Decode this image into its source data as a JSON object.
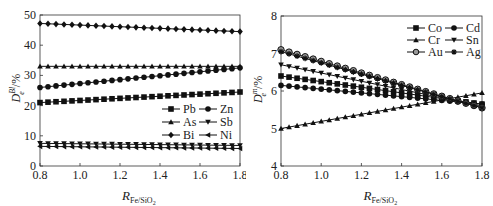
{
  "chart_data": [
    {
      "type": "line",
      "title": "",
      "xlabel": "R_Fe/SiO2",
      "ylabel": "D_e^Bl/%",
      "xlim": [
        0.8,
        1.8
      ],
      "ylim": [
        0,
        50
      ],
      "xticks": [
        "0.8",
        "1.0",
        "1.2",
        "1.4",
        "1.6",
        "1.8"
      ],
      "yticks": [
        "0",
        "10",
        "20",
        "30",
        "40",
        "50"
      ],
      "grid": false,
      "legend_position": "center-right",
      "x": [
        0.8,
        1.8
      ],
      "series": [
        {
          "name": "Pb",
          "marker": "square",
          "values": [
            21.0,
            24.5
          ]
        },
        {
          "name": "Zn",
          "marker": "circle",
          "values": [
            26.0,
            32.5
          ]
        },
        {
          "name": "As",
          "marker": "triangle-up",
          "values": [
            33.0,
            33.0
          ]
        },
        {
          "name": "Sb",
          "marker": "triangle-down",
          "values": [
            7.5,
            6.8
          ]
        },
        {
          "name": "Bi",
          "marker": "diamond",
          "values": [
            47.2,
            44.5
          ]
        },
        {
          "name": "Ni",
          "marker": "triangle-left",
          "values": [
            6.5,
            5.8
          ]
        }
      ]
    },
    {
      "type": "line",
      "title": "",
      "xlabel": "R_Fe/SiO2",
      "ylabel": "D_e^m/%",
      "xlim": [
        0.8,
        1.8
      ],
      "ylim": [
        4,
        8
      ],
      "xticks": [
        "0.8",
        "1.0",
        "1.2",
        "1.4",
        "1.6",
        "1.8"
      ],
      "yticks": [
        "4",
        "5",
        "6",
        "7",
        "8"
      ],
      "grid": false,
      "legend_position": "upper-right",
      "x": [
        0.8,
        1.8
      ],
      "series": [
        {
          "name": "Co",
          "marker": "square",
          "values": [
            6.4,
            5.65
          ]
        },
        {
          "name": "Cd",
          "marker": "circle",
          "values": [
            6.15,
            5.65
          ]
        },
        {
          "name": "Cr",
          "marker": "triangle-up",
          "values": [
            5.0,
            5.95
          ]
        },
        {
          "name": "Sn",
          "marker": "triangle-down",
          "values": [
            6.7,
            5.6
          ]
        },
        {
          "name": "Au",
          "marker": "open-circle",
          "values": [
            7.1,
            5.55
          ]
        },
        {
          "name": "Ag",
          "marker": "star",
          "values": [
            7.05,
            5.55
          ]
        }
      ]
    }
  ],
  "left": {
    "ylabel_main": "D",
    "ylabel_sup": "Bl",
    "ylabel_sub": "e",
    "ylabel_unit": "/%",
    "xlabel_main": "R",
    "xlabel_sub": "Fe/SiO",
    "xlabel_sub2": "2"
  },
  "right": {
    "ylabel_main": "D",
    "ylabel_sup": "m",
    "ylabel_sub": "e",
    "ylabel_unit": "/%",
    "xlabel_main": "R",
    "xlabel_sub": "Fe/SiO",
    "xlabel_sub2": "2"
  }
}
